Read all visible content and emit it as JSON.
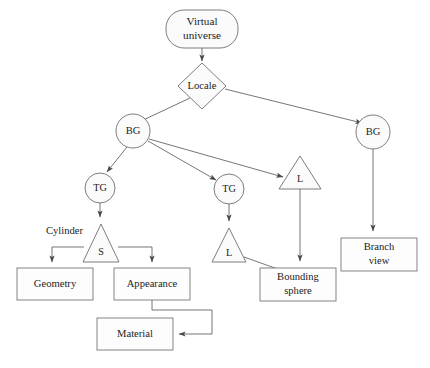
{
  "diagram": {
    "colors": {
      "node_fill": "#fbfbfb",
      "node_stroke": "#6e6e6e",
      "box_fill": "#fdfdfd",
      "box_stroke": "#777777",
      "edge_stroke": "#5d5d5d",
      "text": "#1c1c1c",
      "background": "#ffffff"
    },
    "nodes": [
      {
        "id": "virtual-universe",
        "shape": "rounded-rect",
        "label_line1": "Virtual",
        "label_line2": "universe",
        "x": 202,
        "y": 29,
        "w": 72,
        "h": 38
      },
      {
        "id": "locale",
        "shape": "diamond",
        "label": "Locale",
        "x": 202,
        "y": 86,
        "rx": 24,
        "ry": 23
      },
      {
        "id": "bg-left",
        "shape": "circle",
        "label": "BG",
        "x": 133,
        "y": 131,
        "r": 17
      },
      {
        "id": "bg-right",
        "shape": "circle",
        "label": "BG",
        "x": 373,
        "y": 132,
        "r": 17
      },
      {
        "id": "tg-left",
        "shape": "circle",
        "label": "TG",
        "x": 100,
        "y": 188,
        "r": 15
      },
      {
        "id": "tg-mid",
        "shape": "circle",
        "label": "TG",
        "x": 229,
        "y": 189,
        "r": 15
      },
      {
        "id": "l-upper",
        "shape": "triangle",
        "label": "L",
        "x": 300,
        "y": 156,
        "hw": 21,
        "h": 33
      },
      {
        "id": "s-node",
        "shape": "triangle",
        "label": "S",
        "x": 101,
        "y": 224,
        "hw": 18,
        "h": 38
      },
      {
        "id": "l-lower",
        "shape": "triangle",
        "label": "L",
        "x": 229,
        "y": 228,
        "hw": 17,
        "h": 34
      },
      {
        "id": "geometry",
        "shape": "rect",
        "label": "Geometry",
        "x": 55,
        "y": 284,
        "w": 76,
        "h": 32
      },
      {
        "id": "appearance",
        "shape": "rect",
        "label": "Appearance",
        "x": 152,
        "y": 284,
        "w": 76,
        "h": 32
      },
      {
        "id": "material",
        "shape": "rect",
        "label": "Material",
        "x": 135,
        "y": 334,
        "w": 76,
        "h": 32
      },
      {
        "id": "bounding-sphere",
        "shape": "rect",
        "label_line1": "Bounding",
        "label_line2": "sphere",
        "x": 298,
        "y": 284,
        "w": 76,
        "h": 33
      },
      {
        "id": "branch-view",
        "shape": "rect",
        "label_line1": "Branch",
        "label_line2": "view",
        "x": 379,
        "y": 254,
        "w": 76,
        "h": 33
      }
    ],
    "free_labels": [
      {
        "id": "cylinder-label",
        "text": "Cylinder",
        "x": 46,
        "y": 232
      }
    ],
    "edges": [
      {
        "id": "virtual-universe-to-locale",
        "from": "virtual-universe",
        "to": "locale",
        "arrow": true
      },
      {
        "id": "locale-to-bg-left",
        "from": "locale",
        "to": "bg-left",
        "arrow": true
      },
      {
        "id": "locale-to-bg-right",
        "from": "locale",
        "to": "bg-right",
        "arrow": true
      },
      {
        "id": "bg-left-to-tg-left",
        "from": "bg-left",
        "to": "tg-left",
        "arrow": true
      },
      {
        "id": "bg-left-to-tg-mid",
        "from": "bg-left",
        "to": "tg-mid",
        "arrow": true
      },
      {
        "id": "bg-left-to-l-upper",
        "from": "bg-left",
        "to": "l-upper",
        "arrow": true
      },
      {
        "id": "tg-left-to-s",
        "from": "tg-left",
        "to": "s-node",
        "arrow": true
      },
      {
        "id": "tg-mid-to-l-lower",
        "from": "tg-mid",
        "to": "l-lower",
        "arrow": true
      },
      {
        "id": "s-to-geometry",
        "from": "s-node",
        "to": "geometry",
        "arrow": true
      },
      {
        "id": "s-to-appearance",
        "from": "s-node",
        "to": "appearance",
        "arrow": true
      },
      {
        "id": "appearance-to-material",
        "from": "appearance",
        "to": "material",
        "arrow": true
      },
      {
        "id": "l-lower-to-bounding-sphere",
        "from": "l-lower",
        "to": "bounding-sphere",
        "arrow": true
      },
      {
        "id": "l-upper-to-bounding-sphere",
        "from": "l-upper",
        "to": "bounding-sphere",
        "arrow": true
      },
      {
        "id": "bg-right-to-branch-view",
        "from": "bg-right",
        "to": "branch-view",
        "arrow": true
      }
    ]
  }
}
